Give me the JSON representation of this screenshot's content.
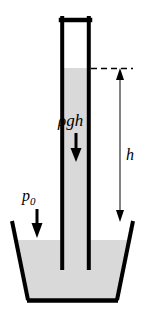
{
  "figure": {
    "type": "physics-schematic",
    "canvas": {
      "width": 145,
      "height": 322
    },
    "colors": {
      "background": "#ffffff",
      "liquid_fill": "#d9d9d9",
      "outline": "#000000",
      "dimension_line": "#555555",
      "vacuum_fill": "#ffffff"
    },
    "labels": {
      "hydrostatic_pressure": "ρgh",
      "atmospheric_pressure": "p",
      "atmospheric_pressure_subscript": "0",
      "height": "h"
    },
    "elements": {
      "tube": {
        "name": "vertical-sealed-tube",
        "left_wall_x": 61,
        "right_wall_x": 90,
        "top_y": 18,
        "bottom_y": 268,
        "wall_thickness": 4,
        "sealed_top": true,
        "open_bottom": true
      },
      "vacuum_region": {
        "name": "vacuum-above-liquid",
        "top_y": 20,
        "bottom_y": 68
      },
      "liquid_column": {
        "name": "liquid-in-tube",
        "surface_y": 68,
        "bottom_y": 300
      },
      "beaker": {
        "name": "open-beaker",
        "top_left_x": 12,
        "top_right_x": 133,
        "top_y": 222,
        "bottom_left_x": 28,
        "bottom_right_x": 117,
        "bottom_y": 300,
        "liquid_surface_y": 240
      },
      "dashed_level_line": {
        "name": "liquid-level-reference",
        "y": 68,
        "from_x": 92,
        "to_x": 132
      },
      "height_dimension": {
        "name": "height-dimension-arrow",
        "x": 120,
        "top_y": 68,
        "bottom_y": 222,
        "double_headed": true
      },
      "rho_gh_arrow": {
        "name": "hydrostatic-pressure-arrow",
        "x": 76,
        "top_y": 133,
        "bottom_y": 162,
        "direction": "down"
      },
      "p0_arrow": {
        "name": "atmospheric-pressure-arrow",
        "x": 37,
        "top_y": 209,
        "bottom_y": 238,
        "direction": "down"
      }
    }
  }
}
